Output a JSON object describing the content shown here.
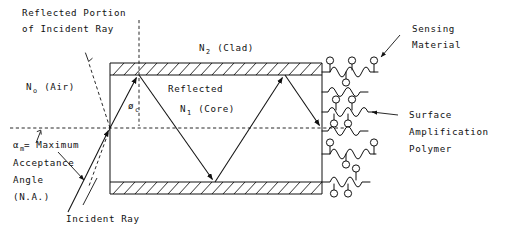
{
  "figure": {
    "background_color": "#ffffff",
    "line_color": "#111111"
  },
  "labels": {
    "reflected_portion_line1": "Reflected Portion",
    "reflected_portion_line2": "of Incident Ray",
    "n0_air": "N",
    "n0_air_sub": "o",
    "n0_air_paren": " (Air)",
    "n2_clad": "N",
    "n2_clad_sub": "2",
    "n2_clad_paren": " (Clad)",
    "reflected": "Reflected",
    "n1_core": "N",
    "n1_core_sub": "1",
    "n1_core_paren": " (Core)",
    "critical_angle": "ø",
    "critical_angle_sub": "c",
    "alpha": "α",
    "alpha_sub": "m",
    "alpha_rest": "= Maximum",
    "acceptance": "Acceptance",
    "angle": "Angle",
    "na": "(N.A.)",
    "incident_ray": "Incident Ray",
    "sensing_line1": "Sensing",
    "sensing_line2": "Material",
    "surface_line1": "Surface",
    "surface_line2": "Amplification",
    "surface_line3": "Polymer"
  },
  "geometry": {
    "waveguide": {
      "left_x": 110,
      "right_x": 322,
      "clad_top_y": 63,
      "clad_top_h": 12,
      "clad_bottom_y": 182,
      "clad_bottom_h": 12,
      "core_top_y": 75,
      "core_bottom_y": 182,
      "axis_y": 128
    },
    "ray_path": [
      {
        "x": 110,
        "y": 128
      },
      {
        "x": 139,
        "y": 75
      },
      {
        "x": 215,
        "y": 182
      },
      {
        "x": 285,
        "y": 75
      },
      {
        "x": 322,
        "y": 128
      }
    ],
    "incident_ray": {
      "from_x": 70,
      "from_y": 208,
      "to_x": 110,
      "to_y": 128
    },
    "reflected_ray": {
      "from_x": 110,
      "from_y": 128,
      "to_x": 88,
      "to_y": 57
    },
    "normal_dashed": {
      "x": 139,
      "y_top": 20,
      "y_bottom": 125
    },
    "acceptance_dashed": {
      "from_x": 110,
      "from_y": 128,
      "to_x": 90,
      "to_y": 185
    },
    "axis_dashed": {
      "x1": 10,
      "x2": 344,
      "y": 128
    }
  },
  "polymer_rows": [
    {
      "y": 78,
      "units": 3,
      "beads": [
        {
          "dx": 4,
          "up": true
        },
        {
          "dx": 17,
          "up": false
        },
        {
          "dx": 23,
          "up": true
        },
        {
          "dx": 38,
          "up": true
        }
      ]
    },
    {
      "y": 100,
      "units": 3,
      "beads": []
    },
    {
      "y": 118,
      "units": 3,
      "beads": [
        {
          "dx": 16,
          "up": true
        },
        {
          "dx": 12,
          "up": false
        },
        {
          "dx": 24,
          "up": false
        },
        {
          "dx": 21,
          "up": true
        }
      ]
    },
    {
      "y": 136,
      "units": 3,
      "beads": []
    },
    {
      "y": 156,
      "units": 3,
      "beads": [
        {
          "dx": 4,
          "up": true
        },
        {
          "dx": 18,
          "up": false
        },
        {
          "dx": 38,
          "up": true
        }
      ]
    },
    {
      "y": 182,
      "units": 3,
      "beads": [
        {
          "dx": 12,
          "up": false
        },
        {
          "dx": 26,
          "up": false
        },
        {
          "dx": 36,
          "up": true
        }
      ]
    }
  ],
  "colors": {
    "ink": "#111111",
    "paper": "#ffffff"
  }
}
